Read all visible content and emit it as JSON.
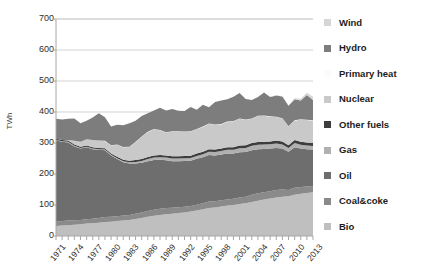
{
  "chart_data": {
    "type": "area",
    "title": "",
    "xlabel": "",
    "ylabel": "TWh",
    "ylim": [
      0,
      700
    ],
    "ytick_step": 100,
    "yticks": [
      "0",
      "100",
      "200",
      "300",
      "400",
      "500",
      "600",
      "700"
    ],
    "grid": true,
    "legend_position": "right",
    "stacked": true,
    "x_start": 1971,
    "x_end": 2013,
    "x_tick_step": 3,
    "x": [
      1971,
      1972,
      1973,
      1974,
      1975,
      1976,
      1977,
      1978,
      1979,
      1980,
      1981,
      1982,
      1983,
      1984,
      1985,
      1986,
      1987,
      1988,
      1989,
      1990,
      1991,
      1992,
      1993,
      1994,
      1995,
      1996,
      1997,
      1998,
      1999,
      2000,
      2001,
      2002,
      2003,
      2004,
      2005,
      2006,
      2007,
      2008,
      2009,
      2010,
      2011,
      2012,
      2013
    ],
    "xticklabels": [
      "1971",
      "1974",
      "1977",
      "1980",
      "1983",
      "1986",
      "1989",
      "1992",
      "1995",
      "1998",
      "2001",
      "2004",
      "2007",
      "2010",
      "2013"
    ],
    "series": [
      {
        "name": "Bio",
        "color": "#bfbfbf",
        "values": [
          32,
          34,
          35,
          36,
          38,
          40,
          41,
          43,
          45,
          46,
          48,
          50,
          52,
          55,
          58,
          62,
          65,
          68,
          70,
          72,
          74,
          76,
          79,
          82,
          86,
          90,
          92,
          95,
          98,
          100,
          103,
          106,
          110,
          114,
          118,
          121,
          124,
          127,
          128,
          133,
          136,
          139,
          141
        ]
      },
      {
        "name": "Coal&coke",
        "color": "#8a8a8a",
        "values": [
          14,
          14,
          15,
          15,
          14,
          14,
          15,
          15,
          16,
          16,
          16,
          16,
          16,
          17,
          18,
          19,
          20,
          20,
          20,
          19,
          19,
          18,
          18,
          19,
          20,
          21,
          20,
          20,
          20,
          20,
          21,
          21,
          23,
          24,
          23,
          23,
          24,
          23,
          20,
          23,
          22,
          21,
          20
        ]
      },
      {
        "name": "Oil",
        "color": "#6e6e6e",
        "values": [
          262,
          256,
          252,
          238,
          230,
          232,
          224,
          220,
          216,
          198,
          184,
          172,
          166,
          162,
          160,
          160,
          160,
          158,
          154,
          150,
          148,
          148,
          146,
          148,
          148,
          150,
          148,
          148,
          148,
          146,
          146,
          144,
          144,
          142,
          140,
          138,
          136,
          132,
          124,
          130,
          124,
          120,
          118
        ]
      },
      {
        "name": "Gas",
        "color": "#b0b0b0",
        "values": [
          2,
          2,
          2,
          2,
          2,
          2,
          2,
          2,
          2,
          2,
          3,
          3,
          4,
          5,
          6,
          7,
          8,
          8,
          9,
          9,
          9,
          9,
          9,
          9,
          10,
          11,
          11,
          11,
          12,
          12,
          13,
          13,
          14,
          14,
          14,
          14,
          14,
          13,
          12,
          14,
          12,
          12,
          11
        ]
      },
      {
        "name": "Other fuels",
        "color": "#3d3d3d",
        "values": [
          4,
          4,
          4,
          4,
          4,
          4,
          4,
          4,
          4,
          4,
          5,
          5,
          5,
          6,
          6,
          7,
          7,
          7,
          7,
          7,
          7,
          7,
          7,
          8,
          8,
          8,
          8,
          8,
          8,
          8,
          9,
          9,
          9,
          9,
          9,
          9,
          10,
          10,
          9,
          10,
          10,
          10,
          10
        ]
      },
      {
        "name": "Nuclear",
        "color": "#c9c9c9",
        "values": [
          0,
          0,
          2,
          12,
          16,
          20,
          24,
          24,
          23,
          26,
          38,
          40,
          44,
          58,
          72,
          80,
          84,
          80,
          74,
          80,
          80,
          78,
          78,
          78,
          80,
          82,
          80,
          78,
          82,
          84,
          86,
          82,
          78,
          84,
          84,
          80,
          76,
          74,
          60,
          62,
          72,
          72,
          72
        ]
      },
      {
        "name": "Primary heat",
        "color": "#fbfbfb",
        "values": [
          0,
          0,
          0,
          0,
          0,
          0,
          0,
          0,
          1,
          1,
          1,
          1,
          1,
          1,
          1,
          1,
          1,
          1,
          1,
          1,
          1,
          1,
          1,
          1,
          1,
          1,
          1,
          1,
          1,
          1,
          1,
          1,
          1,
          1,
          1,
          1,
          1,
          1,
          1,
          1,
          1,
          1,
          1
        ]
      },
      {
        "name": "Hydro",
        "color": "#7d7d7d",
        "values": [
          64,
          66,
          68,
          72,
          60,
          60,
          72,
          88,
          76,
          60,
          64,
          70,
          76,
          68,
          66,
          60,
          60,
          72,
          70,
          72,
          66,
          66,
          78,
          62,
          70,
          52,
          72,
          76,
          72,
          78,
          82,
          66,
          60,
          60,
          74,
          62,
          68,
          70,
          66,
          68,
          60,
          80,
          66
        ]
      },
      {
        "name": "Wind",
        "color": "#d6d6d6",
        "values": [
          0,
          0,
          0,
          0,
          0,
          0,
          0,
          0,
          0,
          0,
          0,
          0,
          0,
          0,
          0,
          0,
          0,
          0,
          0,
          0,
          0,
          0,
          0,
          0,
          0,
          0,
          0,
          0,
          0,
          0,
          0,
          0,
          0,
          1,
          1,
          1,
          1,
          2,
          2,
          3,
          6,
          7,
          10
        ]
      }
    ],
    "series_order_legend": [
      "Wind",
      "Hydro",
      "Primary heat",
      "Nuclear",
      "Other fuels",
      "Gas",
      "Oil",
      "Coal&coke",
      "Bio"
    ]
  },
  "legend": {
    "items": [
      {
        "label": "Wind",
        "color": "#d6d6d6"
      },
      {
        "label": "Hydro",
        "color": "#7d7d7d"
      },
      {
        "label": "Primary heat",
        "color": "#fbfbfb"
      },
      {
        "label": "Nuclear",
        "color": "#c9c9c9"
      },
      {
        "label": "Other fuels",
        "color": "#3d3d3d"
      },
      {
        "label": "Gas",
        "color": "#b0b0b0"
      },
      {
        "label": "Oil",
        "color": "#6e6e6e"
      },
      {
        "label": "Coal&coke",
        "color": "#8a8a8a"
      },
      {
        "label": "Bio",
        "color": "#bfbfbf"
      }
    ]
  },
  "axes": {
    "y_title": "TWh",
    "y_ticks": [
      "700",
      "600",
      "500",
      "400",
      "300",
      "200",
      "100",
      "0"
    ],
    "x_ticks": [
      "1971",
      "1974",
      "1977",
      "1980",
      "1983",
      "1986",
      "1989",
      "1992",
      "1995",
      "1998",
      "2001",
      "2004",
      "2007",
      "2010",
      "2013"
    ]
  },
  "style": {
    "grid_color": "#c8c8c8",
    "axis_color": "#a6a6a6",
    "text_color": "#2e2e2e",
    "background": "#ffffff"
  }
}
